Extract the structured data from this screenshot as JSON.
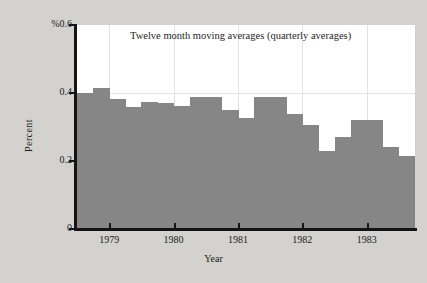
{
  "chart_data": {
    "type": "bar",
    "title": "Twelve month moving averages (quarterly averages)",
    "xlabel": "Year",
    "ylabel": "Percent",
    "y_unit_label": "%",
    "ylim": [
      0,
      0.6
    ],
    "xlim": [
      1978.5,
      1983.75
    ],
    "grid": true,
    "legend": null,
    "y_ticks": [
      {
        "value": 0.6,
        "label": "%0.6"
      },
      {
        "value": 0.4,
        "label": "0.4"
      },
      {
        "value": 0.2,
        "label": "0.2"
      },
      {
        "value": 0.0,
        "label": "0"
      }
    ],
    "x_ticks": [
      {
        "value": 1979,
        "label": "1979"
      },
      {
        "value": 1980,
        "label": "1980"
      },
      {
        "value": 1981,
        "label": "1981"
      },
      {
        "value": 1982,
        "label": "1982"
      },
      {
        "value": 1983,
        "label": "1983"
      }
    ],
    "bar_color": "#868686",
    "categories": [
      "1978 Q4",
      "1979 Q1",
      "1979 Q2",
      "1979 Q3",
      "1979 Q4",
      "1980 Q1",
      "1980 Q2",
      "1980 Q3",
      "1980 Q4",
      "1981 Q1",
      "1981 Q2",
      "1981 Q3",
      "1981 Q4",
      "1982 Q1",
      "1982 Q2",
      "1982 Q3",
      "1982 Q4",
      "1983 Q1",
      "1983 Q2",
      "1983 Q3",
      "1983 Q4"
    ],
    "values": [
      0.4,
      0.415,
      0.383,
      0.358,
      0.375,
      0.372,
      0.363,
      0.388,
      0.388,
      0.351,
      0.327,
      0.388,
      0.388,
      0.337,
      0.307,
      0.228,
      0.272,
      0.322,
      0.322,
      0.24,
      0.215
    ]
  }
}
